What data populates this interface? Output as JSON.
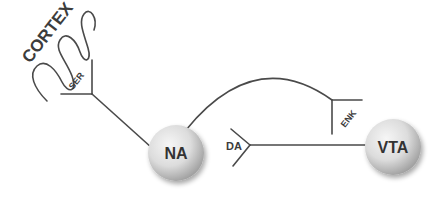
{
  "diagram": {
    "region_label": "CORTEX",
    "nodes": [
      {
        "id": "na",
        "label": "NA"
      },
      {
        "id": "vta",
        "label": "VTA"
      }
    ],
    "connections": [
      {
        "from": "cortex",
        "to": "na",
        "neurotransmitter": "SER"
      },
      {
        "from": "na",
        "to": "vta",
        "neurotransmitter": "ENK"
      },
      {
        "from": "vta",
        "to": "na",
        "neurotransmitter": "DA"
      }
    ],
    "colors": {
      "line": "#4a4a4a",
      "node_light": "#f4f4f4",
      "node_dark": "#a9a9a9"
    }
  }
}
